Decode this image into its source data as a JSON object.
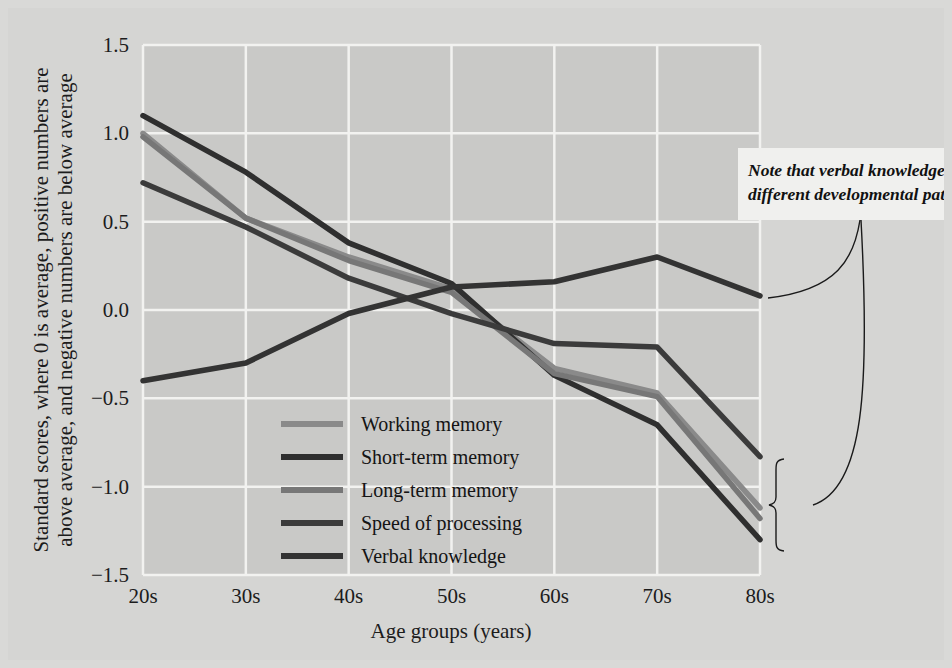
{
  "figure": {
    "background_color": "#d5d5d3",
    "plot_background_color": "#c9c9c7",
    "gridline_color": "#f2f2f0",
    "page_background_color": "#d9d9d7"
  },
  "axes": {
    "x_title": "Age groups (years)",
    "y_title_line1": "Standard scores, where 0 is average, positive numbers are",
    "y_title_line2": "above average, and negative numbers are below average",
    "x_tick_labels": [
      "20s",
      "30s",
      "40s",
      "50s",
      "60s",
      "70s",
      "80s"
    ],
    "y_tick_labels": [
      "1.5",
      "1.0",
      "0.5",
      "0.0",
      "−0.5",
      "−1.0",
      "−1.5"
    ],
    "y_tick_values": [
      1.5,
      1.0,
      0.5,
      0.0,
      -0.5,
      -1.0,
      -1.5
    ]
  },
  "legend": {
    "items": [
      {
        "label": "Working memory",
        "color": "#8a8a8a"
      },
      {
        "label": "Short-term memory",
        "color": "#2f2f2f"
      },
      {
        "label": "Long-term memory",
        "color": "#777777"
      },
      {
        "label": "Speed of processing",
        "color": "#3b3b3b"
      },
      {
        "label": "Verbal knowledge",
        "color": "#333333"
      }
    ]
  },
  "annotation": {
    "text_line1": "Note that verbal knowledge has a",
    "text_line2": "different developmental pattern.",
    "box_background": "#f0f0ee"
  },
  "chart_data": {
    "type": "line",
    "title": "",
    "xlabel": "Age groups (years)",
    "ylabel": "Standard scores, where 0 is average, positive numbers are above average, and negative numbers are below average",
    "categories": [
      "20s",
      "30s",
      "40s",
      "50s",
      "60s",
      "70s",
      "80s"
    ],
    "ylim": [
      -1.5,
      1.5
    ],
    "grid": true,
    "legend_position": "inside-center-left",
    "series": [
      {
        "name": "Working memory",
        "color": "#8a8a8a",
        "values": [
          1.0,
          0.52,
          0.3,
          0.12,
          -0.33,
          -0.47,
          -1.12
        ]
      },
      {
        "name": "Short-term memory",
        "color": "#2f2f2f",
        "values": [
          1.1,
          0.78,
          0.38,
          0.15,
          -0.37,
          -0.65,
          -1.3
        ]
      },
      {
        "name": "Long-term memory",
        "color": "#777777",
        "values": [
          0.98,
          0.52,
          0.28,
          0.1,
          -0.36,
          -0.49,
          -1.18
        ]
      },
      {
        "name": "Speed of processing",
        "color": "#3b3b3b",
        "values": [
          0.72,
          0.47,
          0.18,
          -0.02,
          -0.19,
          -0.21,
          -0.83
        ]
      },
      {
        "name": "Verbal knowledge",
        "color": "#333333",
        "values": [
          -0.4,
          -0.3,
          -0.02,
          0.13,
          0.16,
          0.3,
          0.08
        ]
      }
    ]
  }
}
